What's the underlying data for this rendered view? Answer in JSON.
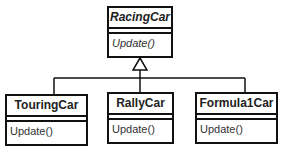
{
  "diagram": {
    "type": "uml-class-diagram",
    "relationship": "generalization",
    "base_class": {
      "name": "RacingCar",
      "abstract": true,
      "operations": [
        "Update()"
      ]
    },
    "subclasses": [
      {
        "name": "TouringCar",
        "operations": [
          "Update()"
        ]
      },
      {
        "name": "RallyCar",
        "operations": [
          "Update()"
        ]
      },
      {
        "name": "Formula1Car",
        "operations": [
          "Update()"
        ]
      }
    ]
  }
}
